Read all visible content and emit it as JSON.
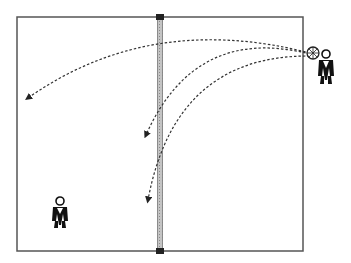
{
  "diagram": {
    "type": "volleyball-serve-drill",
    "court": {
      "x": 17,
      "y": 17,
      "width": 286,
      "height": 234,
      "line_color": "#555555"
    },
    "net": {
      "x": 160,
      "top": 17,
      "bottom": 251,
      "fill": "#b8b8b8",
      "post_color": "#222222"
    },
    "ball": {
      "name": "volleyball",
      "x": 313,
      "y": 53
    },
    "players": [
      {
        "name": "server",
        "x": 326,
        "y": 66
      },
      {
        "name": "receiver",
        "x": 60,
        "y": 212
      }
    ],
    "trajectories": [
      {
        "name": "serve-deep-left",
        "from": [
          310,
          53
        ],
        "ctrl": [
          150,
          20
        ],
        "to": [
          28,
          98
        ]
      },
      {
        "name": "serve-mid",
        "from": [
          310,
          53
        ],
        "ctrl": [
          200,
          30
        ],
        "to": [
          146,
          135
        ]
      },
      {
        "name": "serve-short",
        "from": [
          310,
          54
        ],
        "ctrl": [
          170,
          50
        ],
        "to": [
          148,
          200
        ]
      }
    ]
  }
}
